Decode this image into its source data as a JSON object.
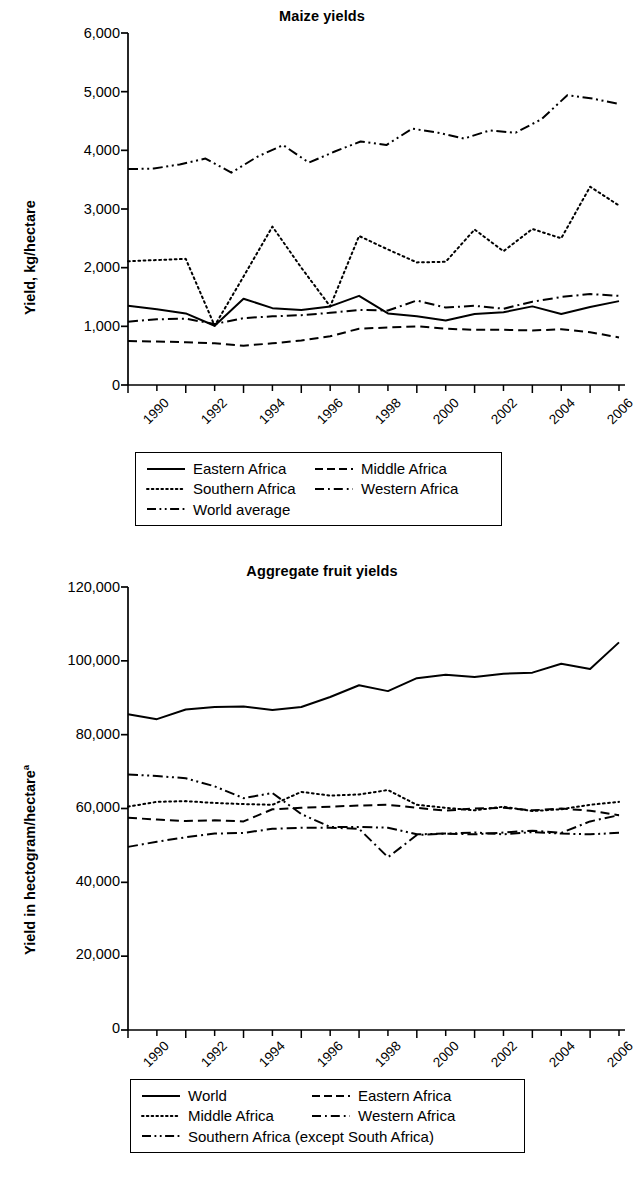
{
  "page": {
    "background": "#ffffff",
    "ink_color": "#000000"
  },
  "charts": [
    {
      "id": "maize",
      "title": "Maize yields",
      "ylabel": "Yield, kg/hectare",
      "ylabel_superscript": "",
      "y_ticks": [
        "0",
        "1,000",
        "2,000",
        "3,000",
        "4,000",
        "5,000",
        "6,000"
      ],
      "x_ticks": [
        "1990",
        "1992",
        "1994",
        "1996",
        "1998",
        "2000",
        "2002",
        "2004",
        "2006"
      ],
      "legend": [
        {
          "label": "Eastern Africa",
          "style": "solid"
        },
        {
          "label": "Middle Africa",
          "style": "dashed"
        },
        {
          "label": "Southern Africa",
          "style": "dotted"
        },
        {
          "label": "Western Africa",
          "style": "dashdot"
        },
        {
          "label": "World average",
          "style": "dashdotdot"
        }
      ]
    },
    {
      "id": "fruit",
      "title": "Aggregate fruit yields",
      "ylabel": "Yield in hectogram/hectare",
      "ylabel_superscript": "a",
      "y_ticks": [
        "0",
        "20,000",
        "40,000",
        "60,000",
        "80,000",
        "100,000",
        "120,000"
      ],
      "x_ticks": [
        "1990",
        "1992",
        "1994",
        "1996",
        "1998",
        "2000",
        "2002",
        "2004",
        "2006"
      ],
      "legend": [
        {
          "label": "World",
          "style": "solid"
        },
        {
          "label": "Eastern Africa",
          "style": "dashed"
        },
        {
          "label": "Middle Africa",
          "style": "dotted"
        },
        {
          "label": "Western Africa",
          "style": "dashdot"
        },
        {
          "label": "Southern Africa (except South Africa)",
          "style": "dashdotdot"
        }
      ]
    }
  ],
  "chart_data": [
    {
      "type": "line",
      "title": "Maize yields",
      "xlabel": "",
      "ylabel": "Yield, kg/hectare",
      "x": [
        1990,
        1991,
        1992,
        1993,
        1994,
        1995,
        1996,
        1997,
        1998,
        1999,
        2000,
        2001,
        2002,
        2003,
        2004,
        2005,
        2006,
        2007
      ],
      "xlim": [
        1990,
        2007
      ],
      "ylim": [
        0,
        6000
      ],
      "ytick_values": [
        0,
        1000,
        2000,
        3000,
        4000,
        5000,
        6000
      ],
      "xtick_values": [
        1990,
        1992,
        1994,
        1996,
        1998,
        2000,
        2002,
        2004,
        2006
      ],
      "grid": false,
      "legend_position": "below",
      "series": [
        {
          "name": "Eastern Africa",
          "style": "solid",
          "values": [
            1350,
            1290,
            1220,
            1010,
            1470,
            1310,
            1280,
            1340,
            1520,
            1220,
            1170,
            1100,
            1210,
            1240,
            1340,
            1210,
            1330,
            1430
          ]
        },
        {
          "name": "Middle Africa",
          "style": "dashed",
          "values": [
            750,
            740,
            730,
            710,
            670,
            710,
            760,
            830,
            960,
            980,
            1000,
            960,
            940,
            940,
            930,
            950,
            900,
            810
          ]
        },
        {
          "name": "Southern Africa",
          "style": "dotted",
          "values": [
            2110,
            2130,
            2150,
            1010,
            1850,
            2700,
            2000,
            1340,
            2540,
            2310,
            2090,
            2100,
            2650,
            2280,
            2660,
            2500,
            3380,
            3060
          ]
        },
        {
          "name": "Western Africa",
          "style": "dashdot",
          "values": [
            1080,
            1120,
            1130,
            1040,
            1140,
            1170,
            1190,
            1230,
            1280,
            1270,
            1440,
            1320,
            1350,
            1300,
            1420,
            1500,
            1550,
            1520
          ]
        },
        {
          "name": "World average",
          "style": "dashdotdot",
          "values": [
            3680,
            3690,
            3760,
            3860,
            3620,
            3890,
            4090,
            3790,
            3980,
            4150,
            4090,
            4370,
            4300,
            4200,
            4340,
            4300,
            4530,
            4940,
            4880,
            4790
          ]
        }
      ]
    },
    {
      "type": "line",
      "title": "Aggregate fruit yields",
      "xlabel": "",
      "ylabel": "Yield in hectogram/hectare",
      "ylabel_note": "a",
      "x": [
        1990,
        1991,
        1992,
        1993,
        1994,
        1995,
        1996,
        1997,
        1998,
        1999,
        2000,
        2001,
        2002,
        2003,
        2004,
        2005,
        2006,
        2007
      ],
      "xlim": [
        1990,
        2007
      ],
      "ylim": [
        0,
        120000
      ],
      "ytick_values": [
        0,
        20000,
        40000,
        60000,
        80000,
        100000,
        120000
      ],
      "xtick_values": [
        1990,
        1992,
        1994,
        1996,
        1998,
        2000,
        2002,
        2004,
        2006
      ],
      "grid": false,
      "legend_position": "below",
      "series": [
        {
          "name": "World",
          "style": "solid",
          "values": [
            85500,
            84200,
            86800,
            87500,
            87600,
            86700,
            87500,
            90200,
            93400,
            91800,
            95300,
            96200,
            95600,
            96500,
            96800,
            99200,
            97800,
            105000
          ]
        },
        {
          "name": "Eastern Africa",
          "style": "dashed",
          "values": [
            57500,
            57000,
            56600,
            56800,
            56500,
            59800,
            60200,
            60500,
            60800,
            61000,
            60200,
            59400,
            60000,
            60200,
            59500,
            60000,
            59400,
            58200
          ]
        },
        {
          "name": "Middle Africa",
          "style": "dotted",
          "values": [
            60500,
            61800,
            62000,
            61500,
            61200,
            61000,
            64500,
            63500,
            63800,
            65000,
            61000,
            60200,
            59500,
            60500,
            59300,
            59800,
            61000,
            61800
          ]
        },
        {
          "name": "Western Africa",
          "style": "dashdot",
          "values": [
            49600,
            51000,
            52200,
            53200,
            53400,
            54500,
            54800,
            54800,
            54500,
            46800,
            52800,
            53200,
            53000,
            53500,
            54000,
            53400,
            56500,
            58200
          ]
        },
        {
          "name": "Southern Africa (except South Africa)",
          "style": "dashdotdot",
          "values": [
            69200,
            68800,
            68200,
            66000,
            62800,
            64200,
            58500,
            55000,
            55000,
            54800,
            53000,
            53200,
            53500,
            53000,
            53600,
            53200,
            53000,
            53400
          ]
        }
      ]
    }
  ]
}
